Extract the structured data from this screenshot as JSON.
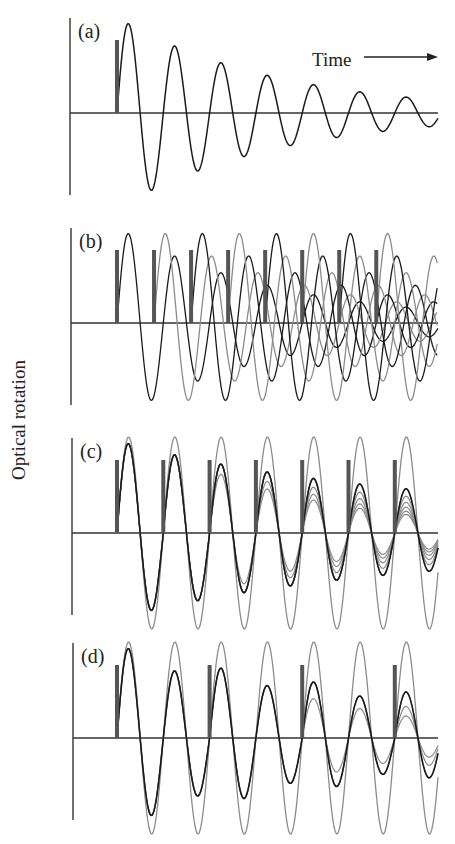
{
  "figure": {
    "y_axis_label": "Optical rotation",
    "time_label": "Time",
    "colors": {
      "dark": "#1a1a1a",
      "light": "#8c8c8c",
      "pulse": "#555555",
      "axis": "#333333"
    }
  },
  "chart_data": {
    "type": "line",
    "title": "",
    "xlabel": "Time",
    "ylabel": "Optical rotation",
    "grid": false,
    "panels": [
      {
        "label": "(a)",
        "description": "Single pulse followed by damped oscillation",
        "pulses_periods": [
          0
        ],
        "components": 1,
        "decay_per_period": 0.75
      },
      {
        "label": "(b)",
        "description": "Pulses at spacing not matching oscillation period (out of phase); components interfere",
        "pulses_periods": [
          0,
          0.8,
          1.6,
          2.4,
          3.2,
          4.0,
          4.8,
          5.6
        ],
        "components": 8,
        "decay_per_period": 0.75
      },
      {
        "label": "(c)",
        "description": "Pulses every period (in phase); amplitude builds up",
        "pulses_periods": [
          0,
          1,
          2,
          3,
          4,
          5,
          6
        ],
        "components": 7,
        "decay_per_period": 0.75
      },
      {
        "label": "(d)",
        "description": "Pulses every two periods (in phase)",
        "pulses_periods": [
          0,
          2,
          4,
          6
        ],
        "components": 4,
        "decay_per_period": 0.75
      }
    ],
    "period_px": 46.3,
    "time_periods_shown": 7
  }
}
